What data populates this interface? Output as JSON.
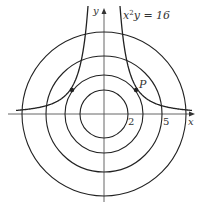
{
  "figure": {
    "equation": "x",
    "equation_sup": "2",
    "equation_rest": "y = 16",
    "point_label": "P",
    "axis_x_label": "x",
    "axis_y_label": "y",
    "tick_labels": [
      "2",
      "5"
    ]
  },
  "geometry": {
    "origin": [
      104,
      114
    ],
    "scale_px_per_unit": 12,
    "circle_radii_px": [
      24,
      39,
      58,
      82
    ],
    "curve_constant": 16,
    "point_P": [
      136,
      90
    ],
    "stroke_color": "#222222"
  }
}
